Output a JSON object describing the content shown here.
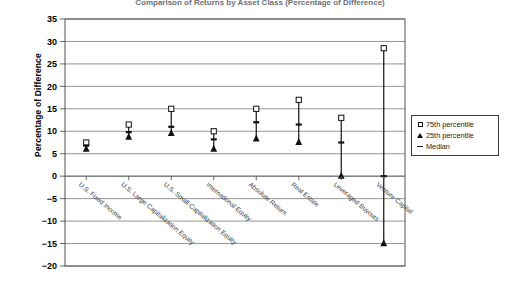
{
  "chart_data": {
    "type": "scatter",
    "title": "Comparison of Returns by Asset Class (Percentage of Difference)",
    "xlabel": "",
    "ylabel": "Percentage of Difference",
    "ylim": [
      -20,
      35
    ],
    "ytick_step": 5,
    "yticks": [
      "35",
      "30",
      "25",
      "20",
      "15",
      "10",
      "5",
      "0",
      "-5",
      "-10",
      "-15",
      "-20"
    ],
    "grid": true,
    "legend_position": "right",
    "categories": [
      "U.S. Fixed Income",
      "U.S. Large Capitalization Equity",
      "U.S. Small Capitalization Equity",
      "International Equity",
      "Absolute Return",
      "Real Estate",
      "Leveraged Buyouts",
      "Venture Capital"
    ],
    "series": [
      {
        "name": "75th percentile",
        "marker": "open-square",
        "values": [
          7.5,
          11.5,
          15.0,
          10.0,
          15.0,
          17.0,
          13.0,
          28.5
        ]
      },
      {
        "name": "25th percentile",
        "marker": "filled-triangle",
        "values": [
          6.0,
          8.7,
          9.5,
          6.0,
          8.3,
          7.5,
          0.0,
          -15.0
        ]
      },
      {
        "name": "Median",
        "marker": "dash",
        "values": [
          6.8,
          9.8,
          11.0,
          8.2,
          12.0,
          11.5,
          7.5,
          0.0
        ]
      }
    ]
  },
  "legend": {
    "items": [
      {
        "label": "75th percentile",
        "marker": "open-square"
      },
      {
        "label": "25th percentile",
        "marker": "filled-triangle"
      },
      {
        "label": "Median",
        "marker": "dash"
      }
    ]
  }
}
